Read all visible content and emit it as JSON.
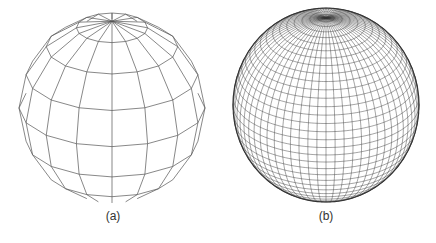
{
  "figure": {
    "panels": [
      {
        "id": "a",
        "caption": "(a)",
        "description": "Coarse polygonal sphere wireframe",
        "center": [
          112,
          108
        ],
        "radius": [
          93,
          95
        ],
        "tilt_deg": 24,
        "meridians": 16,
        "parallels": 8,
        "stroke": "#555555",
        "stroke_width": 0.7,
        "polygonal": true
      },
      {
        "id": "b",
        "caption": "(b)",
        "description": "Fine smooth sphere wireframe",
        "center": [
          108,
          105
        ],
        "radius": [
          93,
          97
        ],
        "tilt_deg": 26,
        "meridians": 64,
        "parallels": 36,
        "stroke": "#333333",
        "stroke_width": 0.45,
        "polygonal": false
      }
    ]
  }
}
